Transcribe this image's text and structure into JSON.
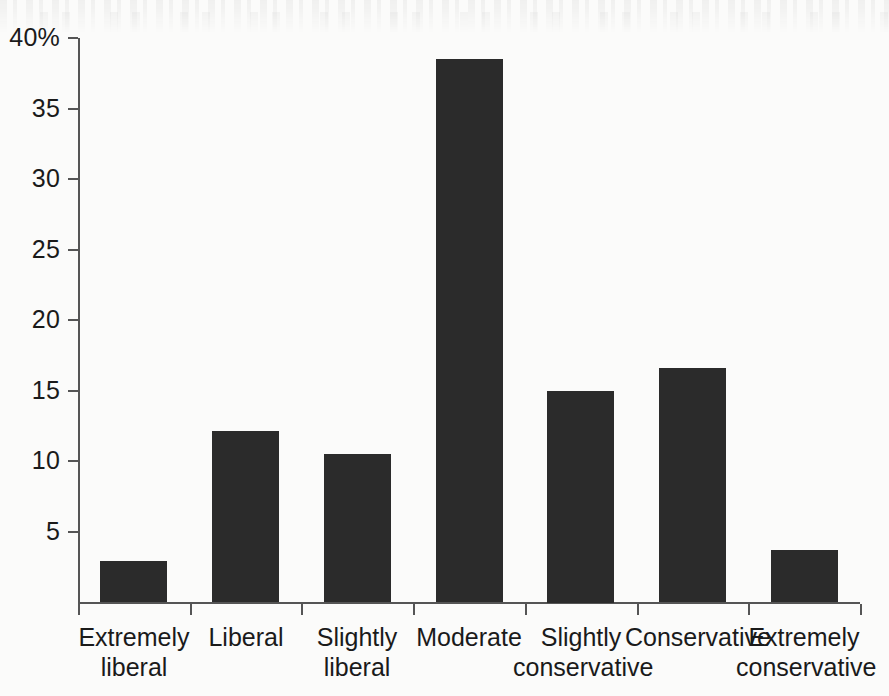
{
  "chart_data": {
    "type": "bar",
    "title": "",
    "xlabel": "",
    "ylabel": "",
    "categories": [
      "Extremely liberal",
      "Liberal",
      "Slightly liberal",
      "Moderate",
      "Slightly conservative",
      "Conservative",
      "Extremely conservative"
    ],
    "category_lines": [
      [
        "Extremely",
        "liberal"
      ],
      [
        "Liberal",
        ""
      ],
      [
        "Slightly",
        "liberal"
      ],
      [
        "Moderate",
        ""
      ],
      [
        "Slightly",
        "conservative"
      ],
      [
        "Conservative",
        ""
      ],
      [
        "Extremely",
        "conservative"
      ]
    ],
    "values": [
      2.9,
      12.1,
      10.5,
      38.5,
      15.0,
      16.6,
      3.7
    ],
    "unit": "%",
    "ylim": [
      0,
      40
    ],
    "ytick_values": [
      40,
      35,
      30,
      25,
      20,
      15,
      10,
      5
    ],
    "ytick_labels": [
      "40%",
      "35",
      "30",
      "25",
      "20",
      "15",
      "10",
      "5"
    ],
    "grid": false,
    "legend": false,
    "bar_color": "#2b2b2b",
    "axis_color": "#555555",
    "background_color": "#fbfbfa"
  }
}
